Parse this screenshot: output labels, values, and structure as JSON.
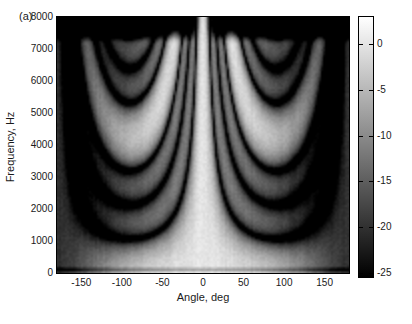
{
  "figure": {
    "panel_label": "(a)",
    "xlabel": "Angle, deg",
    "ylabel": "Frequency, Hz"
  },
  "chart_data": {
    "type": "heatmap",
    "title": "",
    "panel_label": "(a)",
    "xlabel": "Angle, deg",
    "ylabel": "Frequency, Hz",
    "x_range_deg": [
      -180,
      180
    ],
    "y_range_hz": [
      0,
      8000
    ],
    "xticks": [
      -150,
      -100,
      -50,
      0,
      50,
      100,
      150
    ],
    "yticks": [
      0,
      1000,
      2000,
      3000,
      4000,
      5000,
      6000,
      7000,
      8000
    ],
    "grid": false,
    "legend": "none",
    "colorbar": {
      "position": "right",
      "units": "dB",
      "vmin": -25.4,
      "vmax": 2.9,
      "ticks": [
        0,
        -5,
        -10,
        -15,
        -20,
        -25
      ],
      "colormap": "gray"
    },
    "model": {
      "kind": "uniform-linear-array-delay-sum-beampattern (estimated from pixels)",
      "n_elements": 4,
      "spacing_m": 0.0807,
      "c_mps": 343,
      "element_taper_a": 0.55,
      "hf_fade_start_hz": 7150,
      "hf_fade_end_hz": 7750,
      "hf_atten_db": 30,
      "hf_mainlobe_keep_deg": 14,
      "lf_dip_hz": 110,
      "lf_dip_width_hz": 55,
      "lf_dip_db": 8,
      "noise_db": 1.5
    },
    "plot_layout": {
      "plot_left": 57,
      "plot_top": 17,
      "plot_width": 292,
      "plot_height": 256,
      "cbar_left": 359,
      "cbar_top": 17,
      "cbar_width": 14,
      "cbar_height": 260,
      "render_cols": 146,
      "render_rows": 128
    }
  }
}
